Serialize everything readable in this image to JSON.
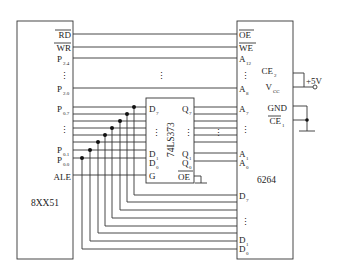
{
  "diagram": {
    "type": "circuit-schematic",
    "chips": {
      "mcu": {
        "name": "8XX51",
        "pins": [
          {
            "label": "RD",
            "overline": true
          },
          {
            "label": "WR",
            "overline": true
          },
          {
            "label": "P",
            "sub": "2.4"
          },
          {
            "label": "⋮"
          },
          {
            "label": "P",
            "sub": "2.0"
          },
          {
            "label": "P",
            "sub": "0.7"
          },
          {
            "label": "⋮"
          },
          {
            "label": "P",
            "sub": "0.1"
          },
          {
            "label": "P",
            "sub": "0.0"
          },
          {
            "label": "ALE"
          }
        ]
      },
      "latch": {
        "name": "74LS373",
        "left_pins": [
          {
            "label": "D",
            "sub": "7"
          },
          {
            "label": "⋮"
          },
          {
            "label": "D",
            "sub": "1"
          },
          {
            "label": "D",
            "sub": "0"
          },
          {
            "label": "G"
          }
        ],
        "right_pins": [
          {
            "label": "Q",
            "sub": "7"
          },
          {
            "label": "⋮"
          },
          {
            "label": "Q",
            "sub": "1"
          },
          {
            "label": "Q",
            "sub": "0"
          },
          {
            "label": "OE",
            "overline": true
          }
        ]
      },
      "memory": {
        "name": "6264",
        "pins": [
          {
            "label": "OE",
            "overline": true
          },
          {
            "label": "WE",
            "overline": true
          },
          {
            "label": "A",
            "sub": "12"
          },
          {
            "label": "⋮"
          },
          {
            "label": "A",
            "sub": "8"
          },
          {
            "label": "A",
            "sub": "7"
          },
          {
            "label": "⋮"
          },
          {
            "label": "A",
            "sub": "1"
          },
          {
            "label": "A",
            "sub": "0"
          },
          {
            "label": "D",
            "sub": "7"
          },
          {
            "label": "⋮"
          },
          {
            "label": "D",
            "sub": "1"
          },
          {
            "label": "D",
            "sub": "0"
          }
        ],
        "inner_pins": [
          {
            "label": "CE",
            "sub": "2"
          },
          {
            "label": "V",
            "sub": "CC"
          },
          {
            "label": "GND"
          },
          {
            "label": "CE",
            "sub": "1",
            "overline": true
          }
        ]
      }
    },
    "power_label": "+5V",
    "middle_ellipsis": "⋮"
  }
}
